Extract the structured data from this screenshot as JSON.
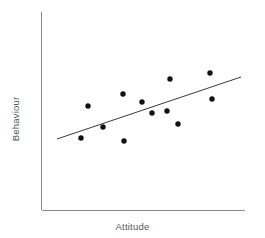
{
  "chart_data": {
    "type": "scatter",
    "title": "",
    "xlabel": "Attitude",
    "ylabel": "Behaviour",
    "grid": false,
    "legend": null,
    "axis_color": "#8a8a8a",
    "point_color": "#111111",
    "line_color": "#3a3a3a",
    "point_radius": 2.7,
    "xlim": [
      41,
      245
    ],
    "ylim": [
      12,
      210
    ],
    "axes": {
      "y_axis": {
        "x": 41.5,
        "y_top": 12,
        "y_bottom": 210
      },
      "x_axis": {
        "y": 210,
        "x_left": 41.5,
        "x_right": 245
      }
    },
    "trend_line": {
      "x1": 57,
      "y1": 139,
      "x2": 241,
      "y2": 77
    },
    "n_points": 12,
    "points": [
      {
        "x": 81,
        "y": 138
      },
      {
        "x": 88,
        "y": 106
      },
      {
        "x": 103,
        "y": 127
      },
      {
        "x": 123,
        "y": 94
      },
      {
        "x": 124,
        "y": 141
      },
      {
        "x": 142,
        "y": 102
      },
      {
        "x": 152,
        "y": 113
      },
      {
        "x": 167,
        "y": 111
      },
      {
        "x": 170,
        "y": 79
      },
      {
        "x": 178,
        "y": 124
      },
      {
        "x": 210,
        "y": 73
      },
      {
        "x": 212,
        "y": 99
      }
    ]
  }
}
